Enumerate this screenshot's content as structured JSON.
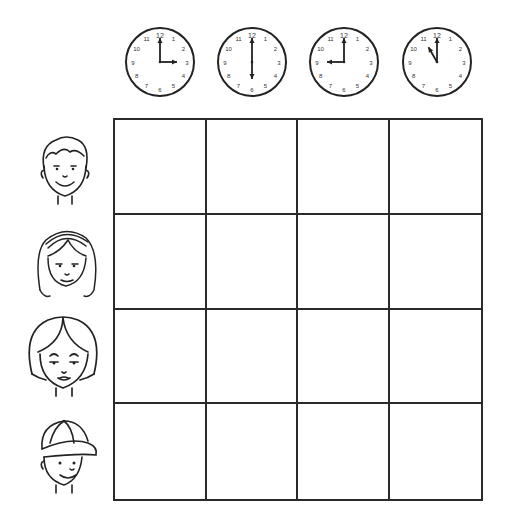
{
  "worksheet": {
    "clocks": [
      {
        "time": "3:00",
        "hour": 3,
        "minute": 0,
        "left": 124,
        "top": 26
      },
      {
        "time": "6:00",
        "hour": 6,
        "minute": 0,
        "left": 216,
        "top": 26
      },
      {
        "time": "9:00",
        "hour": 9,
        "minute": 0,
        "left": 308,
        "top": 26
      },
      {
        "time": "11:00",
        "hour": 11,
        "minute": 0,
        "left": 401,
        "top": 26
      }
    ],
    "clock_numbers": [
      "12",
      "1",
      "2",
      "3",
      "4",
      "5",
      "6",
      "7",
      "8",
      "9",
      "10",
      "11"
    ],
    "people": [
      {
        "id": "boy",
        "label": "boy-short-hair"
      },
      {
        "id": "girl-headband",
        "label": "girl-with-headband"
      },
      {
        "id": "woman",
        "label": "woman-bob-hair"
      },
      {
        "id": "boy-cap",
        "label": "boy-with-cap"
      }
    ],
    "grid": {
      "rows": 4,
      "cols": 4,
      "cells": [
        "",
        "",
        "",
        "",
        "",
        "",
        "",
        "",
        "",
        "",
        "",
        "",
        "",
        "",
        "",
        ""
      ]
    },
    "colors": {
      "line": "#2a2a2a",
      "background": "#ffffff"
    }
  }
}
